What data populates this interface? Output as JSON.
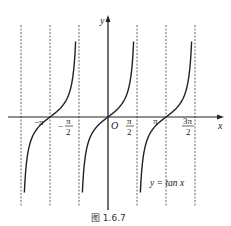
{
  "figure": {
    "caption": "图 1.6.7",
    "function_label": "y = tan x",
    "axis_labels": {
      "x": "x",
      "y": "y",
      "origin": "O"
    },
    "tick_labels": [
      {
        "id": "neg-pi",
        "text": "−π"
      },
      {
        "id": "neg-half-pi",
        "num": "π",
        "den": "2",
        "sign": "−"
      },
      {
        "id": "half-pi",
        "num": "π",
        "den": "2"
      },
      {
        "id": "pi",
        "text": "π"
      },
      {
        "id": "three-half-pi",
        "num": "3π",
        "den": "2"
      }
    ],
    "asymptotes": [
      "-3π/2",
      "-π/2",
      "π/2",
      "3π/2"
    ],
    "colors": {
      "curve": "#222222",
      "axis": "#222222",
      "asymptote": "#555555"
    }
  },
  "chart_data": {
    "type": "line",
    "title": "y = tan x",
    "caption": "图 1.6.7",
    "xlabel": "x",
    "ylabel": "y",
    "x_ticks": [
      "-π",
      "-π/2",
      "O",
      "π/2",
      "π",
      "3π/2"
    ],
    "asymptotes_x": [
      -4.712,
      -1.571,
      1.571,
      4.712
    ],
    "branches": [
      {
        "center": -3.1416,
        "domain": [
          -4.712,
          -1.571
        ]
      },
      {
        "center": 0,
        "domain": [
          -1.571,
          1.571
        ]
      },
      {
        "center": 3.1416,
        "domain": [
          1.571,
          4.712
        ]
      }
    ],
    "grid": false,
    "legend": "none"
  }
}
